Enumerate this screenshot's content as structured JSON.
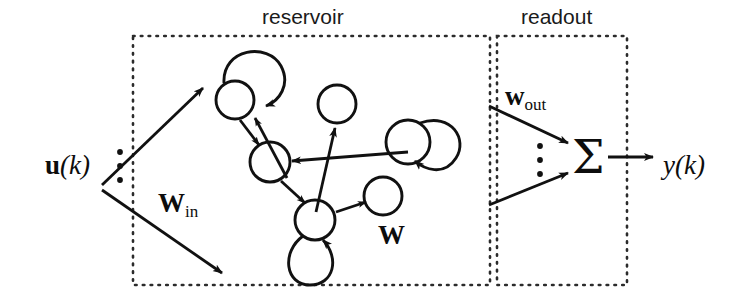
{
  "figure": {
    "type": "schematic-diagram",
    "topic": "echo state network / reservoir computing architecture",
    "background_color": "#ffffff",
    "stroke_color": "#111111"
  },
  "boxes": [
    {
      "key": "reservoir",
      "label": "reservoir",
      "label_x": 310,
      "label_y": 17,
      "x": 133,
      "y": 36,
      "width": 357,
      "height": 249,
      "border_style": "dotted"
    },
    {
      "key": "readout",
      "label": "readout",
      "label_x": 561,
      "label_y": 17,
      "x": 497,
      "y": 36,
      "width": 130,
      "height": 249,
      "border_style": "dotted"
    }
  ],
  "labels": {
    "input_signal": "u(k)",
    "input_signal_x": 45,
    "input_signal_y": 152,
    "input_weights": "W",
    "input_weights_sub": "in",
    "input_weights_x": 158,
    "input_weights_y": 190,
    "reservoir_weights": "W",
    "reservoir_weights_x": 378,
    "reservoir_weights_y": 222,
    "output_weights": "w",
    "output_weights_sub": "out",
    "output_weights_x": 505,
    "output_weights_y": 83,
    "output_signal": "y(k)",
    "output_signal_x": 663,
    "output_signal_y": 152,
    "sigma_symbol": "Σ",
    "sigma_x": 572,
    "sigma_y": 134
  },
  "vertical_dots": [
    {
      "key": "input-dots",
      "x": 120,
      "ys": [
        152,
        166,
        180
      ]
    },
    {
      "key": "readout-dots",
      "x": 540,
      "ys": [
        146,
        160,
        174
      ]
    }
  ],
  "nodes": [
    {
      "id": "n1",
      "cx": 235,
      "cy": 100,
      "r": 19
    },
    {
      "id": "n2",
      "cx": 270,
      "cy": 162,
      "r": 20
    },
    {
      "id": "n3",
      "cx": 337,
      "cy": 104,
      "r": 19
    },
    {
      "id": "n4",
      "cx": 315,
      "cy": 220,
      "r": 20
    },
    {
      "id": "n5",
      "cx": 383,
      "cy": 196,
      "r": 19
    },
    {
      "id": "n6",
      "cx": 408,
      "cy": 142,
      "r": 22
    }
  ],
  "self_loops": [
    {
      "node": "n1",
      "orientation": "top-right"
    },
    {
      "node": "n4",
      "orientation": "bottom"
    },
    {
      "node": "n6",
      "orientation": "right"
    }
  ],
  "edges": [
    {
      "from": "input",
      "to": "reservoir-upper",
      "kind": "input-arrow"
    },
    {
      "from": "input",
      "to": "reservoir-lower",
      "kind": "input-arrow"
    },
    {
      "from": "n1",
      "to": "n2",
      "kind": "arrow"
    },
    {
      "from": "n2",
      "to": "n1",
      "kind": "arrow"
    },
    {
      "from": "n2",
      "to": "n4",
      "kind": "arrow"
    },
    {
      "from": "n4",
      "to": "n3",
      "kind": "arrow"
    },
    {
      "from": "n4",
      "to": "n5",
      "kind": "arrow"
    },
    {
      "from": "n6",
      "to": "n2",
      "kind": "arrow"
    },
    {
      "from": "reservoir-upper",
      "to": "sigma",
      "kind": "readout-arrow"
    },
    {
      "from": "reservoir-lower",
      "to": "sigma",
      "kind": "readout-arrow"
    },
    {
      "from": "sigma",
      "to": "output",
      "kind": "output-arrow"
    }
  ]
}
